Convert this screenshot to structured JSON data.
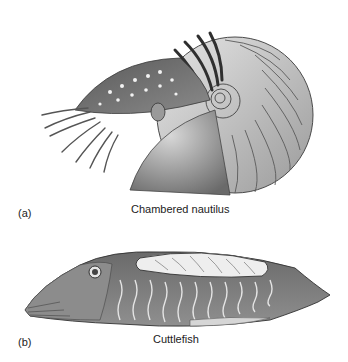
{
  "figure": {
    "panels": [
      {
        "letter": "(a)",
        "caption": "Chambered nautilus",
        "subject": "nautilus-illustration"
      },
      {
        "letter": "(b)",
        "caption": "Cuttlefish",
        "subject": "cuttlefish-illustration"
      }
    ],
    "palette": {
      "background": "#ffffff",
      "ink_dark": "#2b2b2b",
      "ink_mid": "#7a7a7a",
      "ink_light": "#c8c8c8"
    }
  }
}
